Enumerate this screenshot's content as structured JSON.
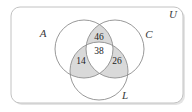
{
  "figure": {
    "type": "venn-diagram",
    "universe_label": "U",
    "background_color": "#ffffff",
    "shade_color": "#d9d9d9",
    "outline_color": "#8d8d8d",
    "border_color": "#c2c2c2",
    "text_color": "#1c1c1c"
  },
  "sets": [
    {
      "key": "A",
      "label": "A",
      "cx": 84,
      "cy": 49,
      "r": 29
    },
    {
      "key": "C",
      "label": "C",
      "cx": 115,
      "cy": 49,
      "r": 29
    },
    {
      "key": "L",
      "label": "L",
      "cx": 99,
      "cy": 71,
      "r": 29
    }
  ],
  "labels": {
    "set_a": "A",
    "set_c": "C",
    "set_l": "L",
    "universe": "U"
  },
  "regions": [
    {
      "name": "A-and-C-only",
      "label": "46",
      "x": 99,
      "y": 37
    },
    {
      "name": "A-and-C-and-L",
      "label": "38",
      "x": 99,
      "y": 51
    },
    {
      "name": "A-and-L-only",
      "label": "14",
      "x": 81,
      "y": 61
    },
    {
      "name": "C-and-L-only",
      "label": "26",
      "x": 117,
      "y": 61
    }
  ],
  "chart_data": {
    "type": "venn",
    "title": "",
    "universe": "U",
    "set_labels": [
      "A",
      "C",
      "L"
    ],
    "categories": [
      "A ∩ C only",
      "A ∩ C ∩ L",
      "A ∩ L only",
      "C ∩ L only"
    ],
    "values": [
      46,
      38,
      14,
      26
    ],
    "shaded_regions": [
      "A ∩ C only",
      "A ∩ C ∩ L",
      "A ∩ L only",
      "C ∩ L only"
    ],
    "unlabeled_regions": [
      "A only",
      "C only",
      "L only",
      "outside all sets"
    ]
  }
}
